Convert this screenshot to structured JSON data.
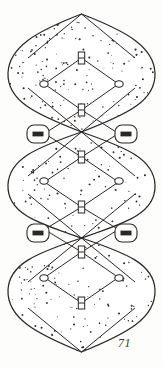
{
  "plate": {
    "title": "Stippled lattice chain figure",
    "page_number": "71",
    "background_color": "#fdfdfc",
    "ink_color": "#2b2723",
    "stipple_color": "#2e2a26",
    "fill_color": "#ffffff"
  },
  "figure_data": {
    "type": "diagram",
    "description": "Vertical chain of three stippled lens-shaped lobes joined at narrow waists, each enclosing a diamond lattice.",
    "canvas": {
      "width": 163,
      "height": 367
    },
    "axis_x": 81.5,
    "lobes": [
      {
        "name": "lobe-top",
        "apex_top": 14,
        "apex_bottom": 132,
        "waist_y": 132,
        "widest_y": 73,
        "left_x": 8,
        "right_x": 155
      },
      {
        "name": "lobe-middle",
        "apex_top": 132,
        "apex_bottom": 238,
        "waist_y": 238,
        "widest_y": 185,
        "left_x": 8,
        "right_x": 155
      },
      {
        "name": "lobe-bottom",
        "apex_top": 238,
        "apex_bottom": 352,
        "waist_y": 352,
        "widest_y": 290,
        "left_x": 8,
        "right_x": 155
      }
    ],
    "h_connectors": [
      {
        "name": "h-connector-1",
        "x": 81.5,
        "y": 58
      },
      {
        "name": "h-connector-2",
        "x": 81.5,
        "y": 110
      },
      {
        "name": "h-connector-3",
        "x": 81.5,
        "y": 157
      },
      {
        "name": "h-connector-4",
        "x": 81.5,
        "y": 207
      },
      {
        "name": "h-connector-5",
        "x": 81.5,
        "y": 252
      },
      {
        "name": "h-connector-6",
        "x": 81.5,
        "y": 303
      }
    ],
    "circle_nodes": [
      {
        "name": "circle-node-top-left",
        "x": 44,
        "y": 84
      },
      {
        "name": "circle-node-top-right",
        "x": 119,
        "y": 84
      },
      {
        "name": "circle-node-mid-left",
        "x": 44,
        "y": 181
      },
      {
        "name": "circle-node-mid-right",
        "x": 119,
        "y": 181
      },
      {
        "name": "circle-node-bot-left",
        "x": 44,
        "y": 278
      },
      {
        "name": "circle-node-bot-right",
        "x": 119,
        "y": 278
      }
    ],
    "lozenge_nodes": [
      {
        "name": "lozenge-node-upper-left",
        "x": 38,
        "y": 134
      },
      {
        "name": "lozenge-node-upper-right",
        "x": 126,
        "y": 134
      },
      {
        "name": "lozenge-node-lower-left",
        "x": 38,
        "y": 233
      },
      {
        "name": "lozenge-node-lower-right",
        "x": 126,
        "y": 233
      }
    ],
    "stipple": {
      "dot_count": 560,
      "dot_radius_min": 0.45,
      "dot_radius_max": 1.05,
      "note": "Irregular hand-stipple texture filling the lobe interiors"
    }
  }
}
